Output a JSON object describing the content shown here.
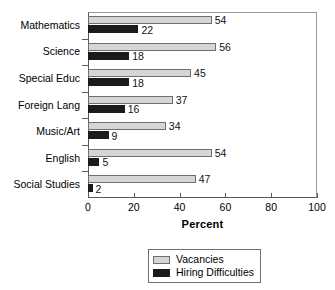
{
  "chart_data": {
    "type": "bar",
    "orientation": "horizontal",
    "title": "",
    "xlabel": "Percent",
    "ylabel": "",
    "xlim": [
      0,
      100
    ],
    "xticks": [
      0,
      20,
      40,
      60,
      80,
      100
    ],
    "grid": false,
    "legend_position": "bottom-center",
    "categories": [
      "Mathematics",
      "Science",
      "Special Educ",
      "Foreign Lang",
      "Music/Art",
      "English",
      "Social Studies"
    ],
    "series": [
      {
        "name": "Vacancies",
        "color": "#d6d6d6",
        "values": [
          54,
          56,
          45,
          37,
          34,
          54,
          47
        ]
      },
      {
        "name": "Hiring Difficulties",
        "color": "#1b1b1b",
        "values": [
          22,
          18,
          18,
          16,
          9,
          5,
          2
        ]
      }
    ]
  },
  "legend": {
    "items": [
      {
        "label": "Vacancies",
        "swatch": "vacancies"
      },
      {
        "label": "Hiring Difficulties",
        "swatch": "hiring"
      }
    ]
  }
}
